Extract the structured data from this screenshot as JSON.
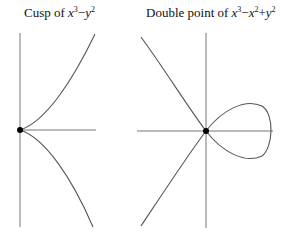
{
  "figures": [
    {
      "id": "cusp",
      "title_prefix": "Cusp of ",
      "polynomial": {
        "terms": [
          {
            "var": "x",
            "exp": "3"
          },
          {
            "op": "−"
          },
          {
            "var": "y",
            "exp": "2"
          }
        ]
      },
      "title_text": "Cusp of x^3−y^2",
      "singular_point": "cusp at origin"
    },
    {
      "id": "double-point",
      "title_prefix": "Double point of ",
      "polynomial": {
        "terms": [
          {
            "var": "x",
            "exp": "3"
          },
          {
            "op": "−"
          },
          {
            "var": "x",
            "exp": "2"
          },
          {
            "op": "+"
          },
          {
            "var": "y",
            "exp": "2"
          }
        ]
      },
      "title_text": "Double point of x^3−x^2+y^2",
      "singular_point": "node (double point) at origin"
    }
  ],
  "colors": {
    "curve": "#555555",
    "axis": "#777777",
    "point": "#000000",
    "text": "#111111"
  }
}
